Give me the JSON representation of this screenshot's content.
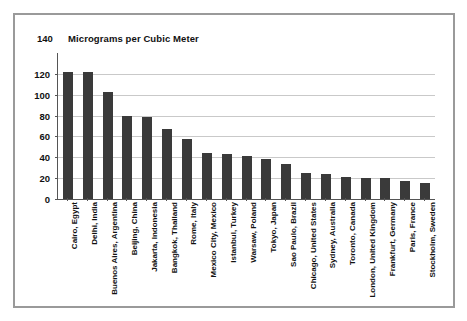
{
  "figure": {
    "frame_color": "#9a9a9a",
    "background": "#ffffff"
  },
  "chart_data": {
    "type": "bar",
    "title": "Micrograms per Cubic Meter",
    "xlabel": "",
    "ylabel": "Micrograms per Cubic Meter",
    "ylim": [
      0,
      140
    ],
    "yticks": [
      0,
      20,
      40,
      60,
      80,
      100,
      120,
      140
    ],
    "ytick_labels": [
      "0",
      "20",
      "40",
      "60",
      "80",
      "100",
      "120",
      "140"
    ],
    "grid": true,
    "legend": false,
    "bar_color": "#3a3a3a",
    "gridline_color": "#c9c9c9",
    "axis_color": "#555555",
    "categories": [
      "Cairo, Egypt",
      "Delhi, India",
      "Buenos Aires, Argentina",
      "Beijing, China",
      "Jakarta, Indonesia",
      "Bangkok, Thailand",
      "Rome, Italy",
      "Mexico City, Mexico",
      "Istanbul, Turkey",
      "Warsaw, Poland",
      "Tokyo, Japan",
      "Sao Paulo, Brazil",
      "Chicago, United States",
      "Sydney, Australia",
      "Toronto, Canada",
      "London, United Kingdom",
      "Frankfurt, Germany",
      "Paris, France",
      "Stockholm, Sweden"
    ],
    "values": [
      122,
      122,
      103,
      80,
      79,
      67,
      58,
      44,
      43,
      41,
      38,
      34,
      25,
      24,
      21,
      20,
      20,
      17,
      15
    ]
  }
}
